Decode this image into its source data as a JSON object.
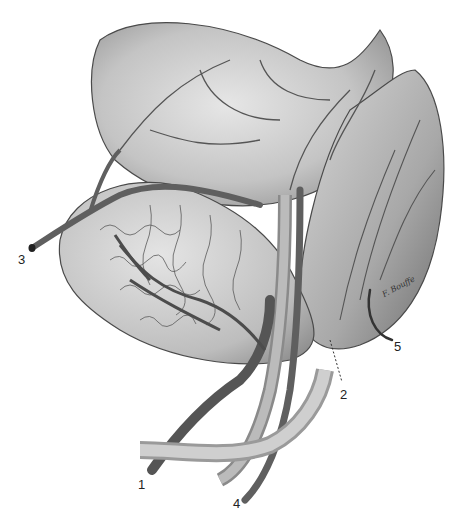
{
  "illustration": {
    "subject": "anatomical illustration of blood vessels supplying organs",
    "signature": "F. Bouffe",
    "labels": [
      {
        "id": "1",
        "text": "1",
        "x": 138,
        "y": 478
      },
      {
        "id": "2",
        "text": "2",
        "x": 340,
        "y": 388
      },
      {
        "id": "3",
        "text": "3",
        "x": 18,
        "y": 253
      },
      {
        "id": "4",
        "text": "4",
        "x": 233,
        "y": 497
      },
      {
        "id": "5",
        "text": "5",
        "x": 394,
        "y": 340
      }
    ],
    "colors": {
      "vessel": "#6f6f6f",
      "vessel_dark": "#3f3f3f",
      "organ_light": "#d9d9d9",
      "organ_mid": "#b3b3b3",
      "outline": "#4a4a4a"
    }
  }
}
